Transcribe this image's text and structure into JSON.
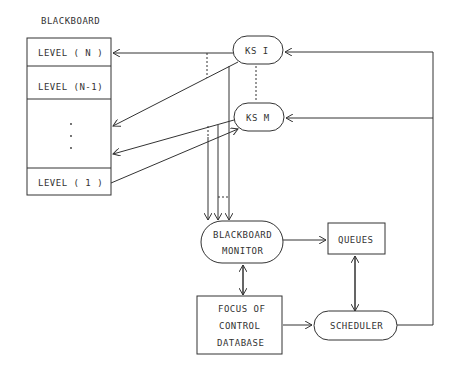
{
  "title": "BLACKBOARD",
  "blackboard_levels": [
    {
      "label": "LEVEL ( N )"
    },
    {
      "label": "LEVEL (N-1)"
    },
    {
      "label": "·\n·\n·"
    },
    {
      "label": "LEVEL ( 1 )"
    }
  ],
  "nodes": {
    "ks_i": "KS I",
    "ks_m": "KS M",
    "monitor_line1": "BLACKBOARD",
    "monitor_line2": "MONITOR",
    "queues": "QUEUES",
    "focus_line1": "FOCUS OF",
    "focus_line2": "CONTROL",
    "focus_line3": "DATABASE",
    "scheduler": "SCHEDULER"
  },
  "colors": {
    "line": "#333333",
    "background": "#ffffff"
  }
}
